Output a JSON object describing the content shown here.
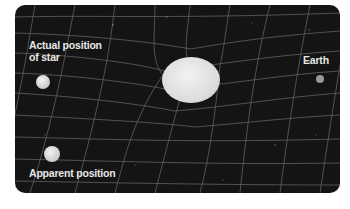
{
  "diagram": {
    "labels": {
      "actual_line1": "Actual position",
      "actual_line2": "of star",
      "earth": "Earth",
      "apparent": "Apparent position"
    },
    "objects": [
      {
        "name": "actual-star",
        "cx": 43,
        "cy": 82,
        "r": 7
      },
      {
        "name": "sun",
        "cx": 191,
        "cy": 80,
        "rx": 29,
        "ry": 23
      },
      {
        "name": "earth",
        "cx": 320,
        "cy": 79,
        "r": 4
      },
      {
        "name": "apparent-star",
        "cx": 52,
        "cy": 154,
        "r": 8
      }
    ],
    "colors": {
      "background": "#151515",
      "grid": "#7a7a7a",
      "text": "#e8e8e8",
      "sphere": "#e6e6e6"
    }
  }
}
